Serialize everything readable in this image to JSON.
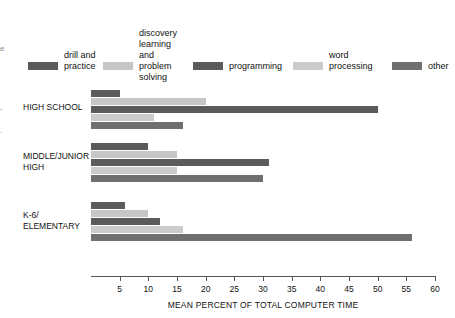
{
  "chart_data": {
    "type": "bar",
    "orientation": "horizontal",
    "title": "",
    "xlabel": "MEAN PERCENT OF TOTAL COMPUTER TIME",
    "ylabel": "",
    "xlim": [
      0,
      60
    ],
    "xticks": [
      5,
      10,
      15,
      20,
      25,
      30,
      35,
      40,
      45,
      50,
      55,
      60
    ],
    "grid": false,
    "legend_position": "top",
    "categories": [
      "HIGH SCHOOL",
      "MIDDLE/JUNIOR\nHIGH",
      "K-6/\nELEMENTARY"
    ],
    "series": [
      {
        "name": "drill and\npractice",
        "color": "#5b5b5b",
        "values": [
          5,
          10,
          6
        ]
      },
      {
        "name": "discovery\nlearning\nand problem\nsolving",
        "color": "#c6c6c6",
        "values": [
          20,
          15,
          10
        ]
      },
      {
        "name": "programming",
        "color": "#5b5b5b",
        "values": [
          50,
          31,
          12
        ]
      },
      {
        "name": "word\nprocessing",
        "color": "#cbcbcb",
        "values": [
          11,
          15,
          16
        ]
      },
      {
        "name": "other",
        "color": "#6f6f6f",
        "values": [
          16,
          30,
          56
        ]
      }
    ]
  },
  "axis": {
    "title": "MEAN PERCENT OF TOTAL COMPUTER TIME",
    "ticks": [
      "5",
      "10",
      "15",
      "20",
      "25",
      "30",
      "35",
      "40",
      "45",
      "50",
      "55",
      "60"
    ]
  },
  "legend": {
    "items": [
      {
        "label": "drill and\npractice",
        "color": "#5b5b5b"
      },
      {
        "label": "discovery\nlearning\nand problem\nsolving",
        "color": "#c6c6c6"
      },
      {
        "label": "programming",
        "color": "#5b5b5b"
      },
      {
        "label": "word\nprocessing",
        "color": "#cbcbcb"
      },
      {
        "label": "other",
        "color": "#6f6f6f"
      }
    ]
  },
  "groups": [
    {
      "label": "HIGH SCHOOL"
    },
    {
      "label": "MIDDLE/JUNIOR\nHIGH"
    },
    {
      "label": "K-6/\nELEMENTARY"
    }
  ],
  "cropped_margin": {
    "mark0": "e",
    "mark1": "-",
    "mark2": "."
  }
}
